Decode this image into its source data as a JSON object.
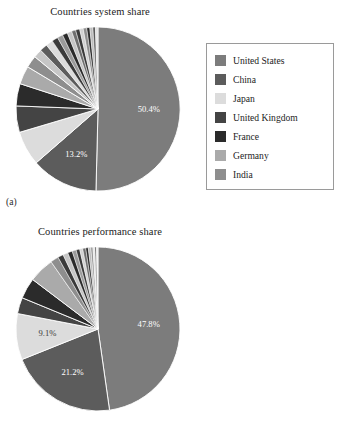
{
  "figure": {
    "background": "#ffffff",
    "panels": [
      {
        "tag": "(a)",
        "title": "Countries system share",
        "legend_title": ""
      },
      {
        "tag": "(b)",
        "title": "Countries performance share",
        "legend_title": ""
      }
    ]
  },
  "palette": {
    "united_states": "#7c7c7c",
    "china": "#5c5c5c",
    "japan": "#dcdcdc",
    "united_kingdom": "#444444",
    "france": "#2b2b2b",
    "germany": "#aaaaaa",
    "india": "#8e8e8e",
    "other_light": "#c6c6c6",
    "other_mid": "#9b9b9b",
    "other_dark": "#3a3a3a",
    "edge": "#ffffff",
    "legend_border": "#9a9a9a",
    "text": "#1d1d1d",
    "label_text": "#ffffff"
  },
  "legend": {
    "entries": [
      {
        "label": "United States",
        "color": "#7c7c7c"
      },
      {
        "label": "China",
        "color": "#5c5c5c"
      },
      {
        "label": "Japan",
        "color": "#dcdcdc"
      },
      {
        "label": "United Kingdom",
        "color": "#444444"
      },
      {
        "label": "France",
        "color": "#2b2b2b"
      },
      {
        "label": "Germany",
        "color": "#aaaaaa"
      },
      {
        "label": "India",
        "color": "#8e8e8e"
      }
    ]
  },
  "chart_data": [
    {
      "type": "pie",
      "id": "countries-system-share",
      "title": "Countries system share",
      "panel": "(a)",
      "start_angle_deg": 0,
      "direction": "clockwise",
      "labels_shown": [
        "50.4%",
        "13.2%"
      ],
      "categories": [
        "United States",
        "China",
        "Japan",
        "United Kingdom",
        "France",
        "Germany",
        "India",
        "Other"
      ],
      "values": [
        50.4,
        13.2,
        6.8,
        5.2,
        4.4,
        3.6,
        2.4,
        14.0
      ],
      "slices": [
        {
          "name": "United States",
          "value": 50.4,
          "color": "#7c7c7c",
          "label": "50.4%"
        },
        {
          "name": "China",
          "value": 13.2,
          "color": "#5c5c5c",
          "label": "13.2%"
        },
        {
          "name": "Japan",
          "value": 6.8,
          "color": "#dcdcdc",
          "label": ""
        },
        {
          "name": "United Kingdom",
          "value": 5.2,
          "color": "#444444",
          "label": ""
        },
        {
          "name": "France",
          "value": 4.4,
          "color": "#2b2b2b",
          "label": ""
        },
        {
          "name": "Germany",
          "value": 3.6,
          "color": "#aaaaaa",
          "label": ""
        },
        {
          "name": "India",
          "value": 2.4,
          "color": "#8e8e8e",
          "label": ""
        },
        {
          "name": "Other 1",
          "value": 1.7,
          "color": "#c6c6c6",
          "label": ""
        },
        {
          "name": "Other 2",
          "value": 1.5,
          "color": "#5c5c5c",
          "label": ""
        },
        {
          "name": "Other 3",
          "value": 1.4,
          "color": "#dcdcdc",
          "label": ""
        },
        {
          "name": "Other 4",
          "value": 1.2,
          "color": "#3a3a3a",
          "label": ""
        },
        {
          "name": "Other 5",
          "value": 1.1,
          "color": "#9b9b9b",
          "label": ""
        },
        {
          "name": "Other 6",
          "value": 1.0,
          "color": "#2b2b2b",
          "label": ""
        },
        {
          "name": "Other 7",
          "value": 0.9,
          "color": "#c6c6c6",
          "label": ""
        },
        {
          "name": "Other 8",
          "value": 0.8,
          "color": "#6e6e6e",
          "label": ""
        },
        {
          "name": "Other 9",
          "value": 0.8,
          "color": "#3a3a3a",
          "label": ""
        },
        {
          "name": "Other 10",
          "value": 0.7,
          "color": "#d2d2d2",
          "label": ""
        },
        {
          "name": "Other 11",
          "value": 0.7,
          "color": "#8e8e8e",
          "label": ""
        },
        {
          "name": "Other 12",
          "value": 0.6,
          "color": "#2b2b2b",
          "label": ""
        },
        {
          "name": "Other 13",
          "value": 0.6,
          "color": "#bdbdbd",
          "label": ""
        },
        {
          "name": "Other 14",
          "value": 0.5,
          "color": "#5c5c5c",
          "label": ""
        },
        {
          "name": "Other 15",
          "value": 0.5,
          "color": "#e4e4e4",
          "label": ""
        }
      ]
    },
    {
      "type": "pie",
      "id": "countries-performance-share",
      "title": "Countries performance share",
      "panel": "(b)",
      "start_angle_deg": 0,
      "direction": "clockwise",
      "labels_shown": [
        "47.8%",
        "21.2%",
        "9.1%"
      ],
      "categories": [
        "United States",
        "China",
        "Japan",
        "United Kingdom",
        "France",
        "Germany",
        "India",
        "Other"
      ],
      "values": [
        47.8,
        21.2,
        9.1,
        3.2,
        4.1,
        5.0,
        1.6,
        8.0
      ],
      "slices": [
        {
          "name": "United States",
          "value": 47.8,
          "color": "#7c7c7c",
          "label": "47.8%"
        },
        {
          "name": "China",
          "value": 21.2,
          "color": "#5c5c5c",
          "label": "21.2%"
        },
        {
          "name": "Japan",
          "value": 9.1,
          "color": "#dcdcdc",
          "label": "9.1%"
        },
        {
          "name": "United Kingdom",
          "value": 3.2,
          "color": "#444444",
          "label": ""
        },
        {
          "name": "France",
          "value": 4.1,
          "color": "#2b2b2b",
          "label": ""
        },
        {
          "name": "Germany",
          "value": 5.0,
          "color": "#aaaaaa",
          "label": ""
        },
        {
          "name": "India",
          "value": 1.6,
          "color": "#8e8e8e",
          "label": ""
        },
        {
          "name": "Other 1",
          "value": 1.1,
          "color": "#3a3a3a",
          "label": ""
        },
        {
          "name": "Other 2",
          "value": 1.0,
          "color": "#c6c6c6",
          "label": ""
        },
        {
          "name": "Other 3",
          "value": 0.9,
          "color": "#2b2b2b",
          "label": ""
        },
        {
          "name": "Other 4",
          "value": 0.8,
          "color": "#9b9b9b",
          "label": ""
        },
        {
          "name": "Other 5",
          "value": 0.7,
          "color": "#3a3a3a",
          "label": ""
        },
        {
          "name": "Other 6",
          "value": 0.6,
          "color": "#d2d2d2",
          "label": ""
        },
        {
          "name": "Other 7",
          "value": 0.6,
          "color": "#6e6e6e",
          "label": ""
        },
        {
          "name": "Other 8",
          "value": 0.5,
          "color": "#2b2b2b",
          "label": ""
        },
        {
          "name": "Other 9",
          "value": 0.5,
          "color": "#bdbdbd",
          "label": ""
        },
        {
          "name": "Other 10",
          "value": 0.4,
          "color": "#8e8e8e",
          "label": ""
        },
        {
          "name": "Other 11",
          "value": 0.4,
          "color": "#e4e4e4",
          "label": ""
        },
        {
          "name": "Other 12",
          "value": 0.3,
          "color": "#5c5c5c",
          "label": ""
        },
        {
          "name": "Other 13",
          "value": 0.3,
          "color": "#efefef",
          "label": ""
        }
      ]
    }
  ]
}
